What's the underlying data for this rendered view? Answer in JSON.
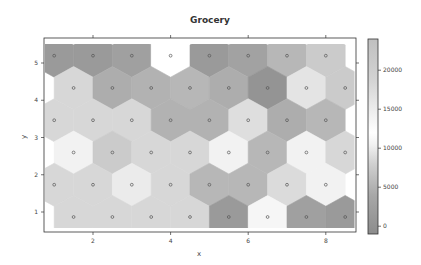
{
  "chart_data": {
    "type": "heatmap",
    "subtype": "hexbin-som",
    "title": "Grocery",
    "xlabel": "x",
    "ylabel": "y",
    "xlim": [
      0.82,
      8.76
    ],
    "ylim": [
      0.45,
      5.65
    ],
    "xticks": [
      2,
      4,
      6,
      8
    ],
    "yticks": [
      1,
      2,
      3,
      4,
      5
    ],
    "colorbar": {
      "ticks": [
        0,
        5000,
        10000,
        15000,
        20000
      ],
      "range": [
        -1000,
        24000
      ]
    },
    "grid_rows": [
      {
        "y": 5.196,
        "x": [
          1,
          2,
          3,
          4,
          5,
          6,
          7,
          8
        ],
        "values": [
          1500,
          1500,
          2500,
          12000,
          1500,
          3000,
          5500,
          7500
        ]
      },
      {
        "y": 4.33,
        "x": [
          1.5,
          2.5,
          3.5,
          4.5,
          5.5,
          6.5,
          7.5,
          8.5
        ],
        "values": [
          8500,
          4500,
          5000,
          5500,
          4500,
          500,
          9500,
          7500
        ]
      },
      {
        "y": 3.464,
        "x": [
          1,
          2,
          3,
          4,
          5,
          6,
          7,
          8
        ],
        "values": [
          8500,
          8500,
          8500,
          5000,
          5000,
          9000,
          4500,
          5500
        ]
      },
      {
        "y": 2.598,
        "x": [
          1.5,
          2.5,
          3.5,
          4.5,
          5.5,
          6.5,
          7.5,
          8.5
        ],
        "values": [
          10500,
          7500,
          8500,
          8500,
          10500,
          5500,
          10500,
          8500
        ]
      },
      {
        "y": 1.732,
        "x": [
          1,
          2,
          3,
          4,
          5,
          6,
          7,
          8
        ],
        "values": [
          8500,
          8500,
          10000,
          8500,
          5500,
          5500,
          8800,
          10500
        ]
      },
      {
        "y": 0.866,
        "x": [
          1.5,
          2.5,
          3.5,
          4.5,
          5.5,
          6.5,
          7.5,
          8.5
        ],
        "values": [
          8500,
          8500,
          8500,
          8500,
          1500,
          11000,
          2500,
          1500
        ]
      }
    ]
  },
  "ui": {
    "title": "Grocery",
    "xlabel": "x",
    "ylabel": "y"
  }
}
